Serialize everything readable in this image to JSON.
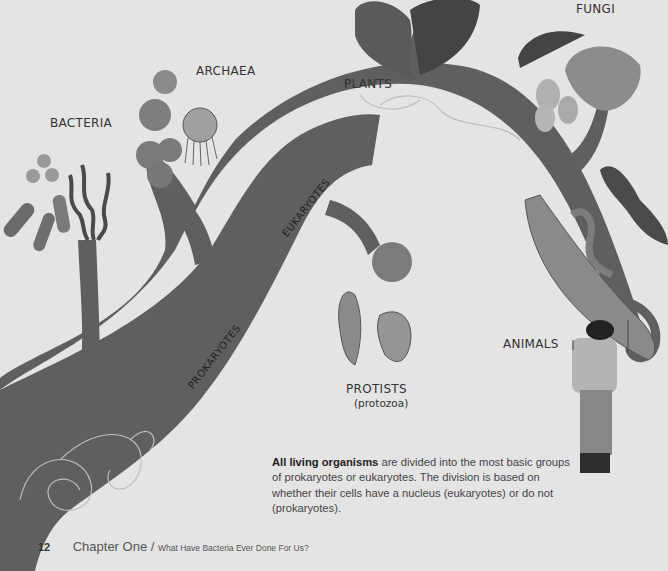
{
  "figure": {
    "groups": {
      "bacteria": "BACTERIA",
      "archaea": "ARCHAEA",
      "plants": "PLANTS",
      "fungi": "FUNGI",
      "protists": "PROTISTS",
      "protists_sub": "(protozoa)",
      "animals": "ANIMALS"
    },
    "branches": {
      "prokaryotes": "PROKARYOTES",
      "eukaryotes": "EUKARYOTES"
    },
    "colors": {
      "background": "#e4e4e4",
      "trunk": "#5f5f5f",
      "text": "#333333"
    }
  },
  "caption": {
    "bold": "All living organisms",
    "rest": " are divided into the most basic groups of prokaryotes or eukaryotes. The division is based on whether their cells have a nucleus (eukaryotes) or do not (prokaryotes)."
  },
  "footer": {
    "page_number": "12",
    "chapter": "Chapter One",
    "separator": " / ",
    "subtitle": "What Have Bacteria Ever Done For Us?"
  }
}
